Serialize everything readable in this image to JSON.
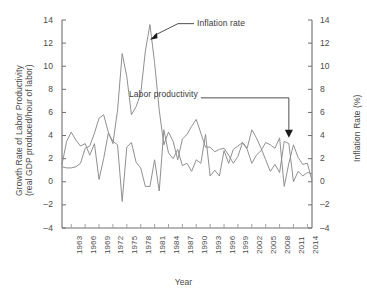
{
  "chart_data": {
    "type": "line",
    "title": "",
    "xlabel": "Year",
    "ylabel": "Growth Rate of Labor Productivity (real GDP produced/hour of labor)",
    "ylabel_right": "Inflation Rate (%)",
    "ylim": [
      -4,
      14
    ],
    "ylim_right": [
      -4,
      14
    ],
    "yticks": [
      -4,
      -2,
      0,
      2,
      4,
      6,
      8,
      10,
      12,
      14
    ],
    "yticks_right": [
      -4,
      -2,
      0,
      2,
      4,
      6,
      8,
      10,
      12,
      14
    ],
    "grid": false,
    "legend": "annotations",
    "xlim": [
      1961,
      2015
    ],
    "xticks": [
      1963,
      1966,
      1969,
      1972,
      1975,
      1978,
      1981,
      1984,
      1987,
      1990,
      1993,
      1996,
      1999,
      2002,
      2005,
      2008,
      2011,
      2014
    ],
    "xtick_labels": [
      "1963",
      "1966",
      "1969",
      "1972",
      "1975",
      "1978",
      "1981",
      "1984",
      "1987",
      "1990",
      "1993",
      "1996",
      "1999",
      "2002",
      "2005",
      "2008",
      "2011",
      "2014"
    ],
    "x": [
      1961,
      1962,
      1963,
      1964,
      1965,
      1966,
      1967,
      1968,
      1969,
      1970,
      1971,
      1972,
      1973,
      1974,
      1975,
      1976,
      1977,
      1978,
      1979,
      1980,
      1981,
      1982,
      1983,
      1984,
      1985,
      1986,
      1987,
      1988,
      1989,
      1990,
      1991,
      1992,
      1993,
      1994,
      1995,
      1996,
      1997,
      1998,
      1999,
      2000,
      2001,
      2002,
      2003,
      2004,
      2005,
      2006,
      2007,
      2008,
      2009,
      2010,
      2011,
      2012,
      2013,
      2014,
      2015
    ],
    "series": [
      {
        "name": "Labor productivity",
        "annotation": "Labor productivity",
        "color": "#8a8a8a",
        "axis": "left",
        "values": [
          1.5,
          3.5,
          4.3,
          3.6,
          3.1,
          3.3,
          2.3,
          3.3,
          0.2,
          2.0,
          4.2,
          3.5,
          3.2,
          -1.7,
          3.0,
          3.4,
          1.7,
          1.2,
          -0.4,
          -0.4,
          1.9,
          -0.8,
          4.5,
          2.5,
          2.0,
          2.8,
          1.4,
          1.6,
          0.9,
          1.9,
          1.6,
          4.1,
          0.5,
          1.0,
          0.5,
          2.7,
          1.6,
          2.8,
          3.1,
          3.4,
          2.9,
          4.5,
          3.8,
          2.9,
          1.9,
          0.9,
          1.5,
          0.8,
          3.5,
          3.3,
          0.0,
          0.9,
          0.5,
          0.8,
          0.7
        ]
      },
      {
        "name": "Inflation rate",
        "annotation": "Inflation rate",
        "color": "#8a8a8a",
        "axis": "right",
        "values": [
          1.3,
          1.2,
          1.2,
          1.3,
          1.6,
          2.9,
          3.1,
          4.2,
          5.5,
          5.8,
          4.3,
          3.3,
          6.2,
          11.1,
          9.1,
          5.8,
          6.5,
          7.6,
          11.3,
          13.6,
          10.3,
          6.2,
          3.2,
          4.3,
          3.5,
          1.9,
          3.7,
          4.1,
          4.8,
          5.4,
          4.2,
          3.0,
          3.0,
          2.6,
          2.8,
          2.9,
          2.3,
          1.6,
          2.2,
          3.4,
          2.8,
          1.6,
          2.3,
          2.7,
          3.4,
          3.2,
          2.9,
          3.8,
          -0.4,
          1.6,
          3.2,
          2.1,
          1.5,
          1.6,
          0.1
        ]
      }
    ],
    "annotations": [
      {
        "text": "Inflation rate",
        "target_x": 1980,
        "target_y": 12.3
      },
      {
        "text": "Labor productivity",
        "target_x": 2010,
        "target_y": 3.8
      }
    ]
  },
  "axis": {
    "left_title_line1": "Growth Rate of Labor Productivity",
    "left_title_line2": "(real GDP produced/hour of labor)",
    "right_title": "Inflation Rate (%)",
    "x_title": "Year"
  }
}
